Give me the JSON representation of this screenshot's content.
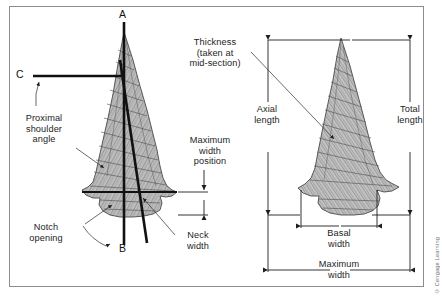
{
  "figure": {
    "credit": "© Cengage Learning",
    "frame_color": "#8a8d8f",
    "background": "#ffffff",
    "line_color": "#1d1d1d",
    "stone_fill": "#b9b9b9"
  },
  "left_diagram": {
    "name": "side-notched-point-with-axes",
    "axis_labels": [
      {
        "id": "A",
        "label": "A",
        "desc": "vertical axis top"
      },
      {
        "id": "B",
        "label": "B",
        "desc": "oblique axis bottom"
      },
      {
        "id": "C",
        "label": "C",
        "desc": "horizontal axis left"
      }
    ],
    "callouts": [
      {
        "id": "proximal-shoulder-angle",
        "label": "Proximal\nshoulder\nangle"
      },
      {
        "id": "notch-opening",
        "label": "Notch\nopening"
      },
      {
        "id": "neck-width",
        "label": "Neck\nwidth"
      },
      {
        "id": "maximum-width-position",
        "label": "Maximum\nwidth\nposition"
      }
    ]
  },
  "right_diagram": {
    "name": "corner-notched-point-with-dimensions",
    "callouts": [
      {
        "id": "thickness",
        "label": "Thickness\n(taken at\nmid-section)"
      }
    ],
    "dimensions": [
      {
        "id": "axial-length",
        "label": "Axial\nlength",
        "orientation": "vertical"
      },
      {
        "id": "total-length",
        "label": "Total\nlength",
        "orientation": "vertical"
      },
      {
        "id": "basal-width",
        "label": "Basal\nwidth",
        "orientation": "horizontal"
      },
      {
        "id": "maximum-width",
        "label": "Maximum\nwidth",
        "orientation": "horizontal"
      }
    ]
  }
}
